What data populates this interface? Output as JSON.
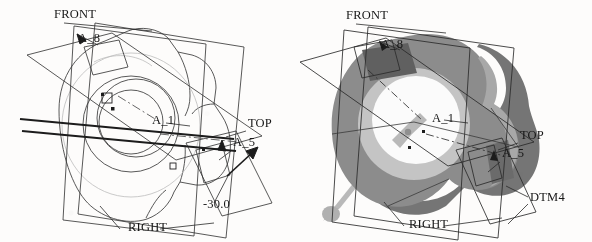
{
  "figure": {
    "type": "cad-screenshot",
    "background_color": "#fdfcfb",
    "panels": [
      {
        "id": "wireframe",
        "render_mode": "wireframe",
        "labels": [
          {
            "name": "front-datum-label",
            "text": "FRONT",
            "x": 54,
            "y": 18
          },
          {
            "name": "a8-datum-label",
            "text": "A_8",
            "x": 78,
            "y": 42
          },
          {
            "name": "a1-axis-label",
            "text": "A_1",
            "x": 152,
            "y": 124
          },
          {
            "name": "top-datum-label",
            "text": "TOP",
            "x": 248,
            "y": 127
          },
          {
            "name": "a5-datum-label",
            "text": "A_5",
            "x": 233,
            "y": 146
          },
          {
            "name": "angle-dimension",
            "text": "-30.0",
            "x": 203,
            "y": 208
          },
          {
            "name": "right-datum-label",
            "text": "RIGHT",
            "x": 128,
            "y": 231
          }
        ]
      },
      {
        "id": "shaded",
        "render_mode": "shaded",
        "colors": {
          "body_front": "#8c8c8c",
          "body_rim": "#a6a6a6",
          "body_side": "#757575",
          "inner_ring": "#c2c2c2",
          "bore": "#fbfbfb",
          "pocket": "#5c5c5c",
          "pin": "#b4b4b4",
          "edge": "#2a2a2a"
        },
        "labels": [
          {
            "name": "front-datum-label",
            "text": "FRONT",
            "x": 50,
            "y": 19
          },
          {
            "name": "a8-datum-label",
            "text": "A_8",
            "x": 85,
            "y": 48
          },
          {
            "name": "a1-axis-label",
            "text": "A_1",
            "x": 136,
            "y": 122
          },
          {
            "name": "top-datum-label",
            "text": "TOP",
            "x": 224,
            "y": 139
          },
          {
            "name": "a5-datum-label",
            "text": "A_5",
            "x": 206,
            "y": 157
          },
          {
            "name": "dtm4-datum-label",
            "text": "DTM4",
            "x": 234,
            "y": 201
          },
          {
            "name": "right-datum-label",
            "text": "RIGHT",
            "x": 113,
            "y": 228
          }
        ]
      }
    ]
  }
}
